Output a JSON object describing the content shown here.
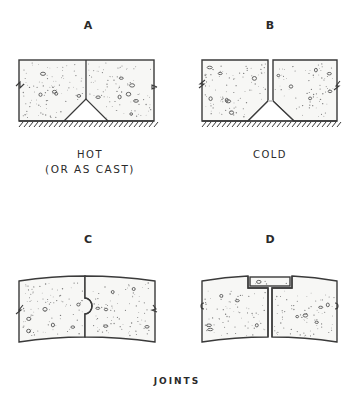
{
  "figure": {
    "title": "JOINTS",
    "panels": [
      {
        "id": "A",
        "letter": "A",
        "caption_line1": "HOT",
        "caption_line2": "(OR AS CAST)",
        "joint_type": "V-notch over subgrade, touching slabs"
      },
      {
        "id": "B",
        "letter": "B",
        "caption_line1": "COLD",
        "caption_line2": "",
        "joint_type": "V-notch over subgrade, open gap between slabs"
      },
      {
        "id": "C",
        "letter": "C",
        "caption_line1": "",
        "caption_line2": "",
        "joint_type": "curved slab, ball-and-socket (round key) joint"
      },
      {
        "id": "D",
        "letter": "D",
        "caption_line1": "",
        "caption_line2": "",
        "joint_type": "curved slab, T-key cap over joint"
      }
    ]
  },
  "colors": {
    "line": "#3a3a3a",
    "background": "#ffffff",
    "aggregate": "#7a7a7a"
  }
}
